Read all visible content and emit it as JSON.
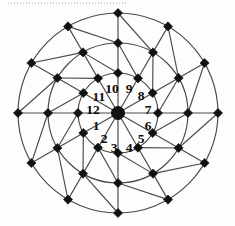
{
  "figure": {
    "center": {
      "x": 118,
      "y": 113
    },
    "ring_count": 3,
    "sector_count": 12,
    "marker_shape": "diamond",
    "line_color": "#4a4a4a",
    "marker_color": "#111111",
    "background_color": "#ffffff"
  },
  "rings": [
    {
      "name": "inner-ring",
      "radius": 40
    },
    {
      "name": "middle-ring",
      "radius": 70
    },
    {
      "name": "outer-ring",
      "radius": 100
    }
  ],
  "sectors": [
    {
      "label": "1",
      "angle_deg": 195,
      "label_x": 96,
      "label_y": 126
    },
    {
      "label": "2",
      "angle_deg": 225,
      "label_x": 104,
      "label_y": 139
    },
    {
      "label": "3",
      "angle_deg": 255,
      "label_x": 114,
      "label_y": 148
    },
    {
      "label": "4",
      "angle_deg": 285,
      "label_x": 129,
      "label_y": 148
    },
    {
      "label": "5",
      "angle_deg": 315,
      "label_x": 141,
      "label_y": 139
    },
    {
      "label": "6",
      "angle_deg": 345,
      "label_x": 148,
      "label_y": 126
    },
    {
      "label": "7",
      "angle_deg": 15,
      "label_x": 148,
      "label_y": 110
    },
    {
      "label": "8",
      "angle_deg": 45,
      "label_x": 141,
      "label_y": 96
    },
    {
      "label": "9",
      "angle_deg": 75,
      "label_x": 129,
      "label_y": 89
    },
    {
      "label": "10",
      "angle_deg": 105,
      "label_x": 112,
      "label_y": 89
    },
    {
      "label": "11",
      "angle_deg": 135,
      "label_x": 99,
      "label_y": 97
    },
    {
      "label": "12",
      "angle_deg": 165,
      "label_x": 93,
      "label_y": 110
    }
  ],
  "scan_artifact": {
    "name": "dotted-scan-line",
    "present": true
  },
  "chart_data": {
    "type": "scatter",
    "xlabel": "",
    "ylabel": "",
    "coordinate_system": "polar",
    "grid": true,
    "legend": "none",
    "axis_ranges": {
      "radius": [
        0,
        100
      ],
      "angle_deg": [
        0,
        360
      ]
    },
    "categories": [
      "1",
      "2",
      "3",
      "4",
      "5",
      "6",
      "7",
      "8",
      "9",
      "10",
      "11",
      "12"
    ],
    "tick_labels": [
      "1",
      "2",
      "3",
      "4",
      "5",
      "6",
      "7",
      "8",
      "9",
      "10",
      "11",
      "12"
    ],
    "radial_gridlines": [
      40,
      70,
      100
    ],
    "spoke_angles_deg": [
      0,
      30,
      60,
      90,
      120,
      150,
      180,
      210,
      240,
      270,
      300,
      330
    ],
    "series": [
      {
        "name": "inner-ring-nodes",
        "radius": 40,
        "values": [
          40,
          40,
          40,
          40,
          40,
          40,
          40,
          40,
          40,
          40,
          40,
          40
        ]
      },
      {
        "name": "middle-ring-nodes",
        "radius": 70,
        "values": [
          70,
          70,
          70,
          70,
          70,
          70,
          70,
          70,
          70,
          70,
          70,
          70
        ]
      },
      {
        "name": "outer-ring-nodes",
        "radius": 100,
        "values": [
          100,
          100,
          100,
          100,
          100,
          100,
          100,
          100,
          100,
          100,
          100,
          100
        ]
      }
    ],
    "annotations": [
      {
        "text": "1",
        "angle_deg": 195
      },
      {
        "text": "2",
        "angle_deg": 225
      },
      {
        "text": "3",
        "angle_deg": 255
      },
      {
        "text": "4",
        "angle_deg": 285
      },
      {
        "text": "5",
        "angle_deg": 315
      },
      {
        "text": "6",
        "angle_deg": 345
      },
      {
        "text": "7",
        "angle_deg": 15
      },
      {
        "text": "8",
        "angle_deg": 45
      },
      {
        "text": "9",
        "angle_deg": 75
      },
      {
        "text": "10",
        "angle_deg": 105
      },
      {
        "text": "11",
        "angle_deg": 135
      },
      {
        "text": "12",
        "angle_deg": 165
      }
    ]
  }
}
